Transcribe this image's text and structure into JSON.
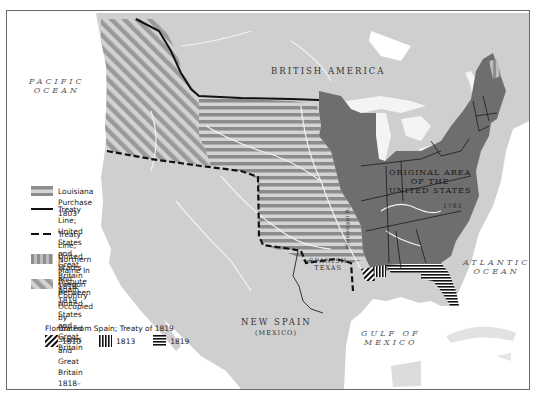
{
  "map": {
    "labels": {
      "pacific_ocean": [
        "PACIFIC",
        "OCEAN"
      ],
      "british_america": "BRITISH AMERICA",
      "original_area": [
        "ORIGINAL AREA",
        "OF THE",
        "UNITED STATES"
      ],
      "original_area_year": "1783",
      "spanish_texas": [
        "SPANISH",
        "TEXAS"
      ],
      "new_spain": "NEW SPAIN",
      "new_spain_sub": "(MEXICO)",
      "atlantic_ocean": [
        "ATLANTIC",
        "OCEAN"
      ],
      "gulf_of_mexico": [
        "GULF OF",
        "MEXICO"
      ],
      "mississippi": "Mississippi R."
    },
    "colors": {
      "water": "#ffffff",
      "land": "#cfcfcf",
      "original_us": "#6e6e6e",
      "louisiana_stripe": "#8e8e8e",
      "oregon_stripe": "#9a9a9a",
      "rivers": "#f2f2f2",
      "treaty_line": "#111111"
    }
  },
  "legend": {
    "items": [
      {
        "swatch": "louisiana-purchase",
        "text": [
          "Louisiana Purchase 1803"
        ]
      },
      {
        "swatch": "treaty-solid",
        "text": [
          "Treaty Line; United States",
          "and Great Britain 1818"
        ]
      },
      {
        "swatch": "treaty-dashed",
        "text": [
          "Treaty Line; United States",
          "and Spain 1819"
        ]
      },
      {
        "swatch": "northern-maine",
        "text": [
          "Northern Maine In Dispute Between",
          "United States and Great Britain"
        ]
      },
      {
        "swatch": "oregon-country",
        "text": [
          "Oregon Country Occupied by",
          "United States and Great Britain",
          "1818–1846"
        ]
      }
    ],
    "florida": {
      "title": "Florida From Spain; Treaty of 1819",
      "years": [
        {
          "pattern": "diagonal",
          "label": "1810"
        },
        {
          "pattern": "vertical",
          "label": "1813"
        },
        {
          "pattern": "horizontal",
          "label": "1819"
        }
      ]
    }
  }
}
